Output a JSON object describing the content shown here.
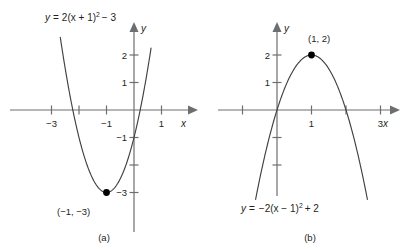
{
  "figure": {
    "background_color": "#ffffff",
    "curve_color": "#414042",
    "axis_color": "#6d6e71",
    "text_color": "#231f20",
    "point_color": "#000000"
  },
  "panels": [
    {
      "id": "a",
      "subcaption": "(a)",
      "equation": {
        "lhs": "y",
        "equals": "=",
        "body_pre": "2(x + 1)",
        "exponent": "2",
        "body_post": "− 3",
        "full_text": "y = 2(x + 1)² − 3"
      },
      "vertex": {
        "label": "(−1, −3)",
        "x": -1,
        "y": -3
      },
      "x_axis": {
        "name": "x",
        "labeled_ticks": [
          "−3",
          "−1",
          "1"
        ]
      },
      "y_axis": {
        "name": "y",
        "labeled_ticks": [
          "2",
          "1",
          "−1",
          "−3"
        ]
      }
    },
    {
      "id": "b",
      "subcaption": "(b)",
      "equation": {
        "lhs": "y",
        "equals": "=",
        "body_pre": "−2(x − 1)",
        "exponent": "2",
        "body_post": "+ 2",
        "full_text": "y = −2(x − 1)² + 2"
      },
      "vertex": {
        "label": "(1, 2)",
        "x": 1,
        "y": 2
      },
      "x_axis": {
        "name": "x",
        "labeled_ticks": [
          "1",
          "3"
        ]
      },
      "y_axis": {
        "name": "y",
        "labeled_ticks": [
          "2",
          "1"
        ]
      }
    }
  ],
  "chart_data": [
    {
      "type": "line",
      "panel": "a",
      "title": "",
      "subtitle": "(a)",
      "xlabel": "x",
      "ylabel": "y",
      "xlim": [
        -3.8,
        1.6
      ],
      "ylim": [
        -3.9,
        2.9
      ],
      "grid": false,
      "legend": "none",
      "series": [
        {
          "name": "y = 2(x + 1)² − 3",
          "equation": "y = 2*(x+1)^2 - 3",
          "a": 2,
          "h": -1,
          "k": -3,
          "opens": "up",
          "x_domain": [
            -2.68,
            0.62
          ],
          "x": [
            -2.68,
            -2.4,
            -2.2,
            -2.0,
            -1.8,
            -1.6,
            -1.4,
            -1.2,
            -1.0,
            -0.8,
            -0.6,
            -0.4,
            -0.2,
            0.0,
            0.2,
            0.4,
            0.62
          ],
          "y": [
            2.64,
            0.92,
            0.08,
            -1.0,
            -1.72,
            -2.28,
            -2.68,
            -2.92,
            -3.0,
            -2.92,
            -2.68,
            -2.28,
            -1.72,
            -1.0,
            -0.12,
            0.92,
            2.25
          ]
        }
      ],
      "annotations": [
        {
          "kind": "point",
          "label": "(−1, −3)",
          "x": -1,
          "y": -3
        },
        {
          "kind": "equation",
          "label": "y = 2(x + 1)² − 3",
          "x": -2.3,
          "y": 2.75
        }
      ],
      "x_ticks": [
        -3,
        -2,
        -1,
        0,
        1
      ],
      "x_tick_labels": [
        "−3",
        "",
        "−1",
        "",
        "1"
      ],
      "y_ticks": [
        2,
        1,
        -1,
        -2,
        -3
      ],
      "y_tick_labels": [
        "2",
        "1",
        "−1",
        "",
        "−3"
      ],
      "x_intercepts": [
        -2.22,
        0.22
      ],
      "y_intercept": -1
    },
    {
      "type": "line",
      "panel": "b",
      "title": "",
      "subtitle": "(b)",
      "xlabel": "x",
      "ylabel": "y",
      "xlim": [
        -1.8,
        3.8
      ],
      "ylim": [
        -4.2,
        2.9
      ],
      "grid": false,
      "legend": "none",
      "series": [
        {
          "name": "y = −2(x − 1)² + 2",
          "equation": "y = -2*(x-1)^2 + 2",
          "a": -2,
          "h": 1,
          "k": 2,
          "opens": "down",
          "x_domain": [
            -0.62,
            2.62
          ],
          "x": [
            -0.62,
            -0.4,
            -0.2,
            0.0,
            0.2,
            0.4,
            0.6,
            0.8,
            1.0,
            1.2,
            1.4,
            1.6,
            1.8,
            2.0,
            2.2,
            2.4,
            2.62
          ],
          "y": [
            -3.25,
            -1.92,
            -0.88,
            0.0,
            0.72,
            1.28,
            1.68,
            1.92,
            2.0,
            1.92,
            1.68,
            1.28,
            0.72,
            0.0,
            -0.88,
            -1.92,
            -3.25
          ]
        }
      ],
      "annotations": [
        {
          "kind": "point",
          "label": "(1, 2)",
          "x": 1,
          "y": 2
        },
        {
          "kind": "equation",
          "label": "y = −2(x − 1)² + 2",
          "x": 0.6,
          "y": -3.8
        }
      ],
      "x_ticks": [
        -1,
        0,
        1,
        2,
        3
      ],
      "x_tick_labels": [
        "",
        "",
        "1",
        "",
        "3"
      ],
      "y_ticks": [
        2,
        1,
        -1,
        -2
      ],
      "y_tick_labels": [
        "2",
        "1",
        "",
        ""
      ],
      "x_intercepts": [
        0,
        2
      ],
      "y_intercept": 0
    }
  ]
}
